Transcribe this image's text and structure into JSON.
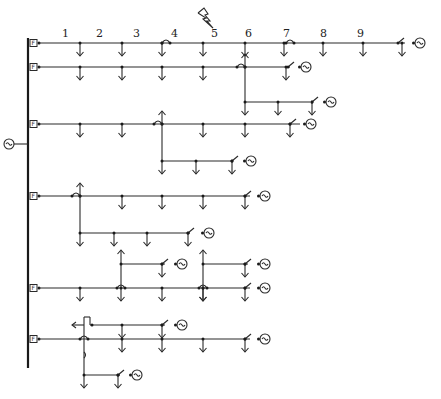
{
  "diagram": {
    "main_bus": {
      "x": 28,
      "y1": 38,
      "y2": 368,
      "source_label": "~"
    },
    "fault_marker": {
      "x": 206,
      "y": 18,
      "label": "fault-lightning"
    },
    "node_labels": [
      {
        "text": "1",
        "x": 62,
        "y": 37
      },
      {
        "text": "2",
        "x": 96,
        "y": 37
      },
      {
        "text": "3",
        "x": 133,
        "y": 37
      },
      {
        "text": "4",
        "x": 171,
        "y": 37
      },
      {
        "text": "5",
        "x": 211,
        "y": 37
      },
      {
        "text": "6",
        "x": 245,
        "y": 37
      },
      {
        "text": "7",
        "x": 283,
        "y": 37
      },
      {
        "text": "8",
        "x": 320,
        "y": 37
      },
      {
        "text": "9",
        "x": 357,
        "y": 37
      }
    ],
    "feeders": [
      {
        "name": "feeder-1",
        "y": 43,
        "breaker_label": "F",
        "x_end": 405,
        "loads": [
          80,
          122,
          162,
          203,
          245,
          284,
          323,
          363,
          402
        ],
        "tie_switch_x": 398,
        "dg_x": 415
      },
      {
        "name": "feeder-2",
        "y": 67,
        "breaker_label": "F",
        "x_end": 290,
        "loads": [
          80,
          122,
          162,
          203,
          286
        ],
        "tie_switch_x": 288,
        "dg_x": 301,
        "branch": {
          "x": 245,
          "y": 102,
          "x_end": 310,
          "loads": [
            245,
            278,
            312
          ],
          "tie_switch_x": 312,
          "dg_x": 326
        }
      },
      {
        "name": "feeder-3",
        "y": 124,
        "breaker_label": "F",
        "x_end": 300,
        "loads": [
          80,
          122,
          203,
          245,
          290
        ],
        "tie_switch_x": 290,
        "dg_x": 306,
        "branch": {
          "x": 162,
          "y": 161,
          "x_end": 232,
          "loads": [
            162,
            196,
            232
          ],
          "tie_switch_x": 232,
          "dg_x": 246
        }
      },
      {
        "name": "feeder-4",
        "y": 196,
        "breaker_label": "F",
        "x_end": 250,
        "loads": [
          122,
          162,
          203,
          245
        ],
        "tie_switch_x": 245,
        "dg_x": 260,
        "branch": {
          "x": 80,
          "y": 233,
          "x_end": 190,
          "loads": [
            80,
            114,
            147,
            188
          ],
          "tie_switch_x": 188,
          "dg_x": 204
        }
      },
      {
        "name": "feeder-5",
        "y": 288,
        "breaker_label": "F",
        "x_end": 250,
        "loads": [
          80,
          162,
          203,
          245
        ],
        "tie_switch_x": 245,
        "dg_x": 260,
        "branches": [
          {
            "x": 121,
            "y": 264,
            "x_end": 165,
            "loads": [
              162
            ],
            "tie_switch_x": 162,
            "dg_x": 177
          },
          {
            "x": 203,
            "y": 264,
            "x_end": 248,
            "loads": [
              245
            ],
            "tie_switch_x": 245,
            "dg_x": 260
          }
        ]
      },
      {
        "name": "feeder-6",
        "y": 339,
        "breaker_label": "F",
        "x_end": 250,
        "loads": [
          122,
          162,
          203,
          245
        ],
        "tie_switch_x": 245,
        "dg_x": 260,
        "branches": [
          {
            "x": 84,
            "y": 325,
            "x_end": 165,
            "loads": [
              122,
              162
            ],
            "tie_switch_x": 162,
            "dg_x": 177
          },
          {
            "x": 84,
            "y": 375,
            "x_end": 120,
            "loads": [
              84,
              118
            ],
            "tie_switch_x": 118,
            "dg_x": 132
          }
        ]
      }
    ]
  }
}
